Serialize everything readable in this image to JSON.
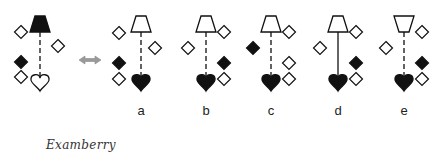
{
  "colors": {
    "stroke": "#111111",
    "fill_dark": "#111111",
    "fill_light": "#ffffff",
    "arrow": "#9a9a9a"
  },
  "problem": {
    "cx": 40,
    "lamp": {
      "y": 16,
      "orientation": "up",
      "filled": true
    },
    "line": "dashed",
    "heart": {
      "y": 81,
      "filled": false
    },
    "diamonds": [
      {
        "x": 21,
        "y": 32,
        "filled": false
      },
      {
        "x": 58,
        "y": 46,
        "filled": false
      },
      {
        "x": 21,
        "y": 62,
        "filled": true
      },
      {
        "x": 21,
        "y": 77,
        "filled": false
      }
    ]
  },
  "arrow": {
    "x": 90,
    "y": 60,
    "glyph": "double-arrow"
  },
  "options": [
    {
      "label": "a",
      "cx": 141,
      "lamp": {
        "y": 16,
        "orientation": "up",
        "filled": false
      },
      "line": "dashed",
      "heart": {
        "y": 81,
        "filled": true
      },
      "diamonds": [
        {
          "x": 119,
          "y": 33,
          "filled": false
        },
        {
          "x": 155,
          "y": 48,
          "filled": false
        },
        {
          "x": 119,
          "y": 63,
          "filled": true
        },
        {
          "x": 119,
          "y": 79,
          "filled": false
        }
      ]
    },
    {
      "label": "b",
      "cx": 206,
      "lamp": {
        "y": 16,
        "orientation": "up",
        "filled": false
      },
      "line": "dashed",
      "heart": {
        "y": 81,
        "filled": true
      },
      "diamonds": [
        {
          "x": 224,
          "y": 32,
          "filled": false
        },
        {
          "x": 188,
          "y": 48,
          "filled": false
        },
        {
          "x": 224,
          "y": 63,
          "filled": true
        },
        {
          "x": 224,
          "y": 79,
          "filled": false
        }
      ]
    },
    {
      "label": "c",
      "cx": 271,
      "lamp": {
        "y": 16,
        "orientation": "up",
        "filled": false
      },
      "line": "dashed",
      "heart": {
        "y": 81,
        "filled": true
      },
      "diamonds": [
        {
          "x": 289,
          "y": 32,
          "filled": false
        },
        {
          "x": 253,
          "y": 48,
          "filled": true
        },
        {
          "x": 289,
          "y": 63,
          "filled": false
        },
        {
          "x": 289,
          "y": 79,
          "filled": false
        }
      ]
    },
    {
      "label": "d",
      "cx": 338,
      "lamp": {
        "y": 16,
        "orientation": "up",
        "filled": false
      },
      "line": "solid",
      "heart": {
        "y": 81,
        "filled": true
      },
      "diamonds": [
        {
          "x": 356,
          "y": 32,
          "filled": false
        },
        {
          "x": 320,
          "y": 48,
          "filled": false
        },
        {
          "x": 356,
          "y": 63,
          "filled": true
        },
        {
          "x": 356,
          "y": 79,
          "filled": false
        }
      ]
    },
    {
      "label": "e",
      "cx": 404,
      "lamp": {
        "y": 16,
        "orientation": "down",
        "filled": false
      },
      "line": "dashed",
      "heart": {
        "y": 81,
        "filled": true
      },
      "diamonds": [
        {
          "x": 422,
          "y": 32,
          "filled": false
        },
        {
          "x": 386,
          "y": 48,
          "filled": false
        },
        {
          "x": 422,
          "y": 63,
          "filled": true
        },
        {
          "x": 422,
          "y": 79,
          "filled": false
        }
      ]
    }
  ],
  "option_labels_y": 112,
  "watermark": "Examberry"
}
